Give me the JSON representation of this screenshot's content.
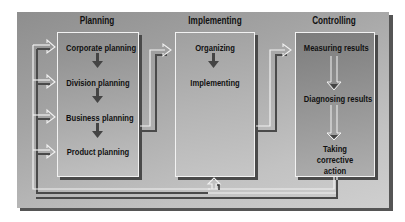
{
  "diagram": {
    "sections": [
      {
        "id": "planning",
        "label": "Planning",
        "items": [
          "Corporate planning",
          "Division planning",
          "Business planning",
          "Product planning"
        ]
      },
      {
        "id": "implementing",
        "label": "Implementing",
        "items": [
          "Organizing",
          "Implementing"
        ]
      },
      {
        "id": "controlling",
        "label": "Controlling",
        "items": [
          "Measuring results",
          "Diagnosing results",
          "Taking corrective action"
        ]
      }
    ],
    "flows": [
      {
        "from": "Planning",
        "to": "Implementing"
      },
      {
        "from": "Implementing",
        "to": "Controlling"
      },
      {
        "from": "Controlling",
        "to": "Planning",
        "type": "feedback"
      },
      {
        "from": "Controlling",
        "to": "Implementing",
        "type": "feedback"
      }
    ],
    "colors": {
      "panel_dark": "#8e8e8e",
      "panel_light": "#cfcfcf",
      "shadow": "#4a4a4a",
      "highlight": "#f2f2f2",
      "text": "#111111"
    }
  }
}
